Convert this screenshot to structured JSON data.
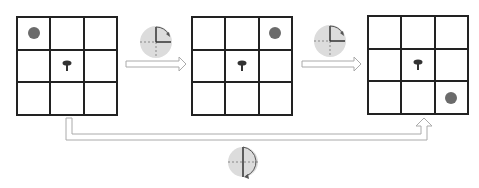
{
  "diagram": {
    "colors": {
      "grid_line": "#222222",
      "ball": "#6b6b6b",
      "pivot": "#333333",
      "rotation_disk": "#dcdcdc",
      "arrow_outline": "#aaaaaa"
    },
    "grids": [
      {
        "id": "grid-1",
        "ball_cell": [
          0,
          0
        ],
        "pivot_cell": [
          1,
          1
        ]
      },
      {
        "id": "grid-2",
        "ball_cell": [
          0,
          2
        ],
        "pivot_cell": [
          1,
          1
        ]
      },
      {
        "id": "grid-3",
        "ball_cell": [
          2,
          2
        ],
        "pivot_cell": [
          1,
          1
        ]
      }
    ],
    "transitions": [
      {
        "from": "grid-1",
        "to": "grid-2",
        "rotation": "90° clockwise"
      },
      {
        "from": "grid-2",
        "to": "grid-3",
        "rotation": "90° clockwise"
      },
      {
        "from": "grid-1",
        "to": "grid-3",
        "rotation": "180°"
      }
    ]
  }
}
